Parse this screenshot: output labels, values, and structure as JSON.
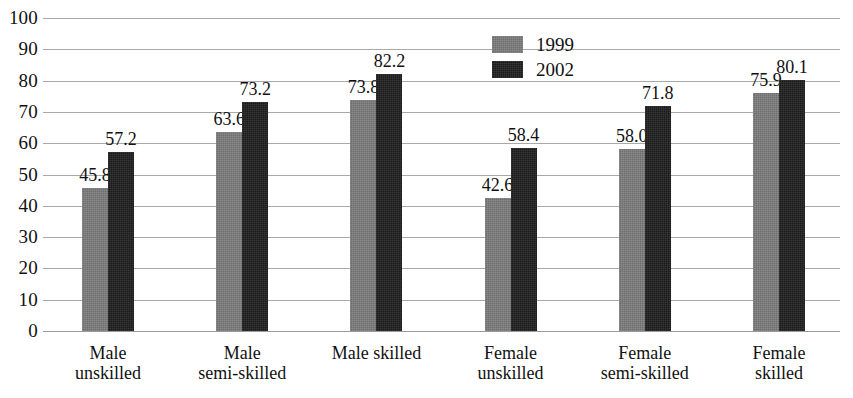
{
  "chart_data": {
    "type": "bar",
    "title": "",
    "xlabel": "",
    "ylabel": "",
    "ylim": [
      0,
      100
    ],
    "yticks": [
      100,
      90,
      80,
      70,
      60,
      50,
      40,
      30,
      20,
      10,
      0
    ],
    "grid": true,
    "legend_position": "top-center",
    "categories": [
      "Male unskilled",
      "Male semi-skilled",
      "Male skilled",
      "Female unskilled",
      "Female semi-skilled",
      "Female skilled"
    ],
    "category_lines": [
      [
        "Male",
        "unskilled"
      ],
      [
        "Male",
        "semi-skilled"
      ],
      [
        "Male skilled",
        ""
      ],
      [
        "Female",
        "unskilled"
      ],
      [
        "Female",
        "semi-skilled"
      ],
      [
        "Female",
        "skilled"
      ]
    ],
    "series": [
      {
        "name": "1999",
        "color": "#6e6e6e",
        "values": [
          45.8,
          63.6,
          73.8,
          42.6,
          58.0,
          75.9
        ],
        "labels": [
          "45.8",
          "63.6",
          "73.8",
          "42.6",
          "58.0",
          "75.9"
        ]
      },
      {
        "name": "2002",
        "color": "#1b1b1b",
        "values": [
          57.2,
          73.2,
          82.2,
          58.4,
          71.8,
          80.1
        ],
        "labels": [
          "57.2",
          "73.2",
          "82.2",
          "58.4",
          "71.8",
          "80.1"
        ]
      }
    ]
  },
  "axis": {
    "tick_labels": [
      "100",
      "90",
      "80",
      "70",
      "60",
      "50",
      "40",
      "30",
      "20",
      "10",
      "0"
    ]
  },
  "legend": {
    "items": [
      {
        "label": "1999",
        "swatch": "legend-swatch-1999"
      },
      {
        "label": "2002",
        "swatch": "legend-swatch-2002"
      }
    ]
  }
}
